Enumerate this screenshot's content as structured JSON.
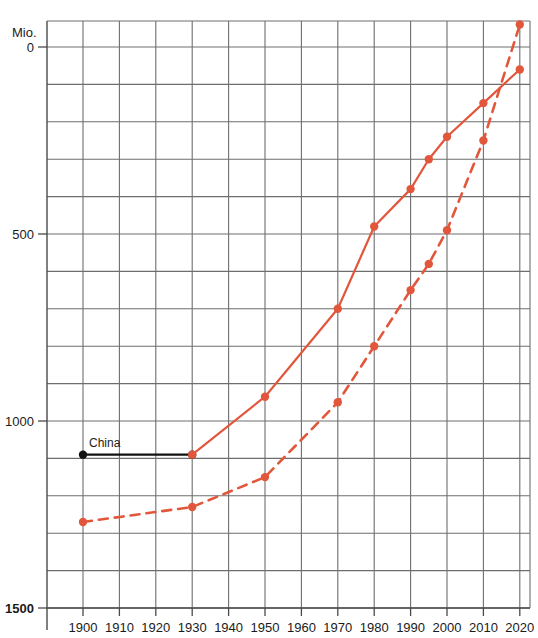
{
  "chart_data": {
    "type": "line",
    "title": "",
    "subtitle": "",
    "unit_label": "Mio.",
    "xlabel": "",
    "ylabel": "",
    "xlim": [
      1895,
      2025
    ],
    "ylim": [
      0,
      1570
    ],
    "grid": true,
    "grid_x_step": 10,
    "grid_y_step": 100,
    "legend_position": "inline-annotation",
    "x_ticks": [
      1900,
      1910,
      1920,
      1930,
      1940,
      1950,
      1960,
      1970,
      1980,
      1990,
      2000,
      2010,
      2020
    ],
    "y_ticks_labeled": [
      0,
      500,
      1000,
      1500
    ],
    "annotations": [
      {
        "text": "China",
        "x_start": 1900,
        "x_end": 1930,
        "y": 410,
        "style": "black-line-with-endpoints"
      }
    ],
    "series": [
      {
        "name": "China",
        "style": "solid",
        "color": "#E2573C",
        "marker": "circle",
        "x": [
          1930,
          1950,
          1970,
          1980,
          1990,
          1995,
          2000,
          2010,
          2020
        ],
        "y": [
          410,
          565,
          800,
          1020,
          1120,
          1200,
          1260,
          1350,
          1440
        ]
      },
      {
        "name": "India",
        "style": "dashed",
        "color": "#E2573C",
        "marker": "circle",
        "x": [
          1900,
          1930,
          1950,
          1970,
          1980,
          1990,
          1995,
          2000,
          2010,
          2020
        ],
        "y": [
          230,
          270,
          350,
          550,
          700,
          850,
          920,
          1010,
          1250,
          1560
        ]
      }
    ]
  },
  "axis": {
    "y_tick_labels": [
      "1500",
      "1000",
      "500",
      "0"
    ],
    "x_tick_labels": [
      "1900",
      "1910",
      "1920",
      "1930",
      "1940",
      "1950",
      "1960",
      "1970",
      "1980",
      "1990",
      "2000",
      "2010",
      "2020"
    ],
    "unit": "Mio."
  },
  "colors": {
    "series_red": "#E2573C",
    "grid": "#6e6e6e",
    "axis": "#4a4a4a",
    "annotation_black": "#111111",
    "text": "#1b1b1b",
    "background": "#ffffff"
  }
}
